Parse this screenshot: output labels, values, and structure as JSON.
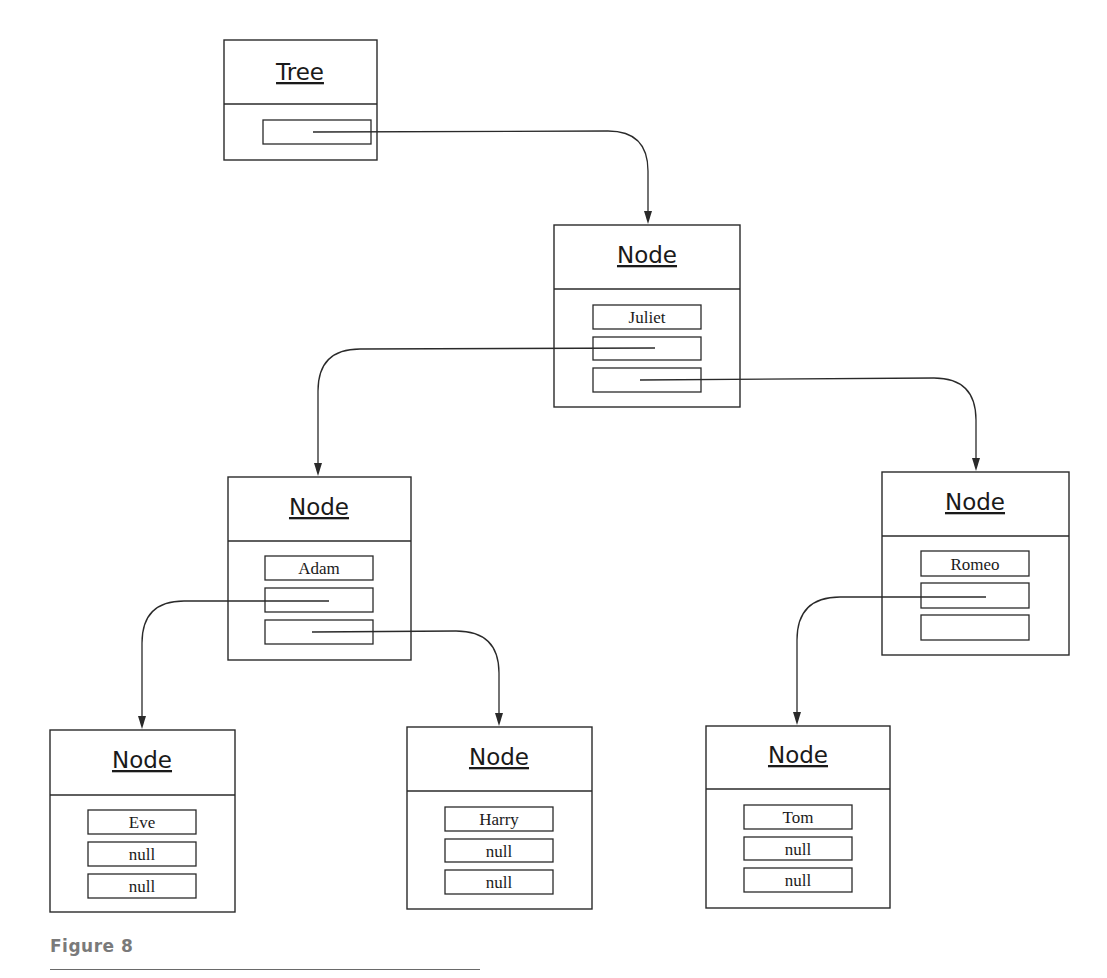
{
  "diagram": {
    "type": "object-reference-diagram",
    "tree": {
      "title": "Tree",
      "fields": [
        ""
      ]
    },
    "nodes": [
      {
        "id": "juliet",
        "title": "Node",
        "fields": [
          "Juliet",
          "",
          ""
        ]
      },
      {
        "id": "adam",
        "title": "Node",
        "fields": [
          "Adam",
          "",
          ""
        ]
      },
      {
        "id": "romeo",
        "title": "Node",
        "fields": [
          "Romeo",
          "",
          ""
        ]
      },
      {
        "id": "eve",
        "title": "Node",
        "fields": [
          "Eve",
          "null",
          "null"
        ]
      },
      {
        "id": "harry",
        "title": "Node",
        "fields": [
          "Harry",
          "null",
          "null"
        ]
      },
      {
        "id": "tom",
        "title": "Node",
        "fields": [
          "Tom",
          "null",
          "null"
        ]
      }
    ],
    "edges": [
      {
        "from": "tree.root",
        "to": "juliet"
      },
      {
        "from": "juliet.left",
        "to": "adam"
      },
      {
        "from": "juliet.right",
        "to": "romeo"
      },
      {
        "from": "adam.left",
        "to": "eve"
      },
      {
        "from": "adam.right",
        "to": "harry"
      },
      {
        "from": "romeo.left",
        "to": "tom"
      }
    ]
  },
  "caption": "Figure 8"
}
